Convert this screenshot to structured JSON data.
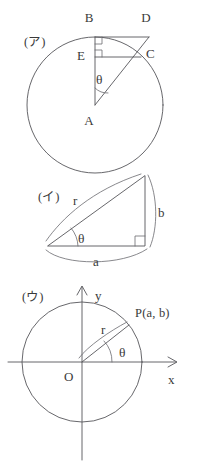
{
  "figure": {
    "background_color": "#ffffff",
    "line_color": "#56565a",
    "text_color": "#3a3a3a",
    "panels": [
      {
        "id": "a",
        "tag": "(ア)",
        "description": "Circle with center A, vertical radius to B, tangent-like segment B to D, chord through C, foot E",
        "labels": {
          "A": "A",
          "B": "B",
          "C": "C",
          "D": "D",
          "E": "E",
          "theta": "θ"
        }
      },
      {
        "id": "b",
        "tag": "(イ)",
        "description": "Right triangle with hypotenuse r, vertical leg b, horizontal leg a, angle theta at left vertex",
        "labels": {
          "r": "r",
          "a": "a",
          "b": "b",
          "theta": "θ"
        }
      },
      {
        "id": "c",
        "tag": "(ウ)",
        "description": "Unit-style circle on x-y axes, origin O, radius r to point P(a, b), angle theta from positive x-axis",
        "labels": {
          "O": "O",
          "x": "x",
          "y": "y",
          "r": "r",
          "theta": "θ",
          "P": "P(a, b)"
        }
      }
    ]
  }
}
